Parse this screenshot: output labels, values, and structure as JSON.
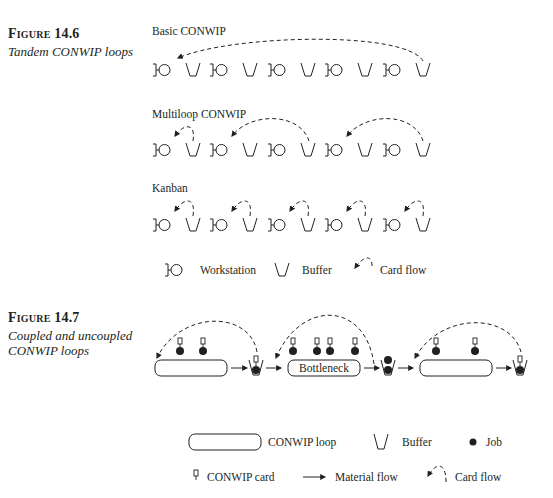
{
  "figure_14_6": {
    "number": "Figure 14.6",
    "caption": "Tandem CONWIP loops",
    "rows": [
      {
        "title": "Basic CONWIP"
      },
      {
        "title": "Multiloop CONWIP"
      },
      {
        "title": "Kanban"
      }
    ],
    "legend": {
      "workstation": "Workstation",
      "buffer": "Buffer",
      "card_flow": "Card flow"
    }
  },
  "figure_14_7": {
    "number": "Figure 14.7",
    "caption_line1": "Coupled and uncoupled",
    "caption_line2": "CONWIP loops",
    "bottleneck_label": "Bottleneck",
    "legend": {
      "conwip_loop": "CONWIP loop",
      "buffer": "Buffer",
      "job": "Job",
      "conwip_card": "CONWIP card",
      "material_flow": "Material flow",
      "card_flow": "Card flow"
    }
  },
  "colors": {
    "ink": "#231f20",
    "background": "#ffffff"
  }
}
